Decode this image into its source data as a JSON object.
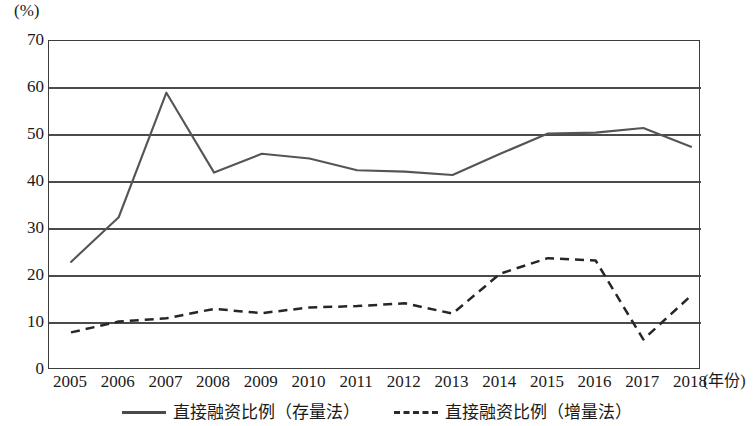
{
  "chart_data": {
    "type": "line",
    "title": "",
    "subtitle": "",
    "xlabel": "(年份)",
    "ylabel": "(%)",
    "unit_label": "(%)",
    "grid": true,
    "legend_position": "bottom",
    "xlim": [
      2005,
      2018
    ],
    "ylim": [
      0,
      70
    ],
    "yticks": [
      0,
      10,
      20,
      30,
      40,
      50,
      60,
      70
    ],
    "ytick_labels": [
      "0",
      "10",
      "20",
      "30",
      "40",
      "50",
      "60",
      "70"
    ],
    "categories": [
      2005,
      2006,
      2007,
      2008,
      2009,
      2010,
      2011,
      2012,
      2013,
      2014,
      2015,
      2016,
      2017,
      2018
    ],
    "xtick_labels": [
      "2005",
      "2006",
      "2007",
      "2008",
      "2009",
      "2010",
      "2011",
      "2012",
      "2013",
      "2014",
      "2015",
      "2016",
      "2017",
      "2018"
    ],
    "series": [
      {
        "name": "直接融资比例（存量法）",
        "style": "solid",
        "color": "#555555",
        "values": [
          23.0,
          32.5,
          59.0,
          42.0,
          46.0,
          45.0,
          42.5,
          42.2,
          41.5,
          46.0,
          50.3,
          50.5,
          51.5,
          47.5
        ]
      },
      {
        "name": "直接融资比例（增量法）",
        "style": "dashed",
        "color": "#262626",
        "values": [
          8.0,
          10.3,
          11.0,
          13.0,
          12.1,
          13.3,
          13.6,
          14.2,
          12.0,
          20.5,
          23.8,
          23.3,
          6.5,
          15.8
        ]
      }
    ]
  },
  "legend": {
    "entries": [
      {
        "label": "直接融资比例（存量法）",
        "style": "solid"
      },
      {
        "label": "直接融资比例（增量法）",
        "style": "dashed"
      }
    ]
  }
}
